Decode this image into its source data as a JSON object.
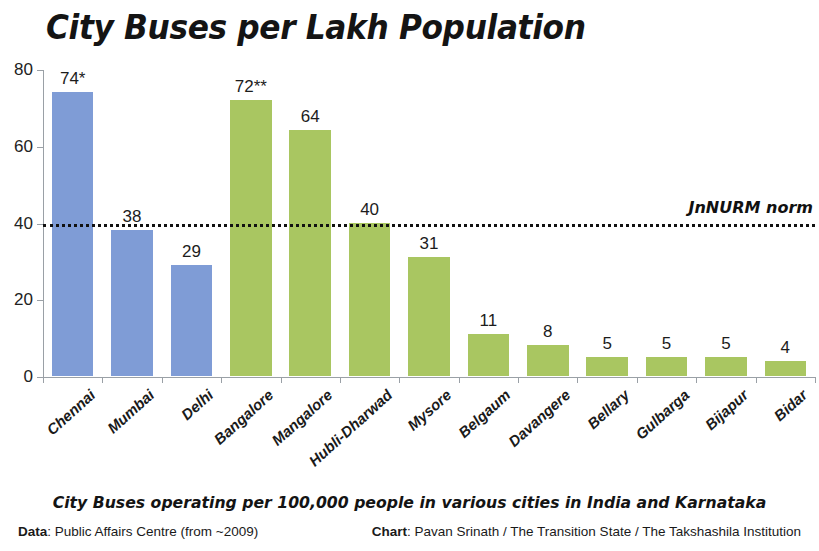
{
  "chart_data": {
    "type": "bar",
    "title": "City Buses per Lakh Population",
    "subtitle": "City Buses operating per 100,000 people in various cities in India and Karnataka",
    "xlabel": "",
    "ylabel": "",
    "ylim": [
      0,
      80
    ],
    "yticks": [
      0,
      20,
      40,
      60,
      80
    ],
    "grid": false,
    "legend": null,
    "categories": [
      "Chennai",
      "Mumbai",
      "Delhi",
      "Bangalore",
      "Mangalore",
      "Hubli-Dharwad",
      "Mysore",
      "Belgaum",
      "Davangere",
      "Bellary",
      "Gulbarga",
      "Bijapur",
      "Bidar"
    ],
    "values": [
      74,
      38,
      29,
      72,
      64,
      40,
      31,
      11,
      8,
      5,
      5,
      5,
      4
    ],
    "value_labels": [
      "74*",
      "38",
      "29",
      "72**",
      "64",
      "40",
      "31",
      "11",
      "8",
      "5",
      "5",
      "5",
      "4"
    ],
    "bar_colors": [
      "#7f9cd6",
      "#7f9cd6",
      "#7f9cd6",
      "#a9c661",
      "#a9c661",
      "#a9c661",
      "#a9c661",
      "#a9c661",
      "#a9c661",
      "#a9c661",
      "#a9c661",
      "#a9c661",
      "#a9c661"
    ],
    "color_groups": {
      "india_metros": "#7f9cd6",
      "karnataka_cities": "#a9c661"
    },
    "annotations": [
      {
        "name": "jnnurm-norm",
        "label": "JnNURM norm",
        "type": "hline",
        "y": 40,
        "style": "dotted",
        "color": "#111111"
      }
    ]
  },
  "footer": {
    "data_credit_label": "Data",
    "data_credit_value": ": Public Affairs Centre (from ~2009)",
    "chart_credit_label": "Chart",
    "chart_credit_value": ": Pavan Srinath / The Transition State / The Takshashila Institution"
  }
}
